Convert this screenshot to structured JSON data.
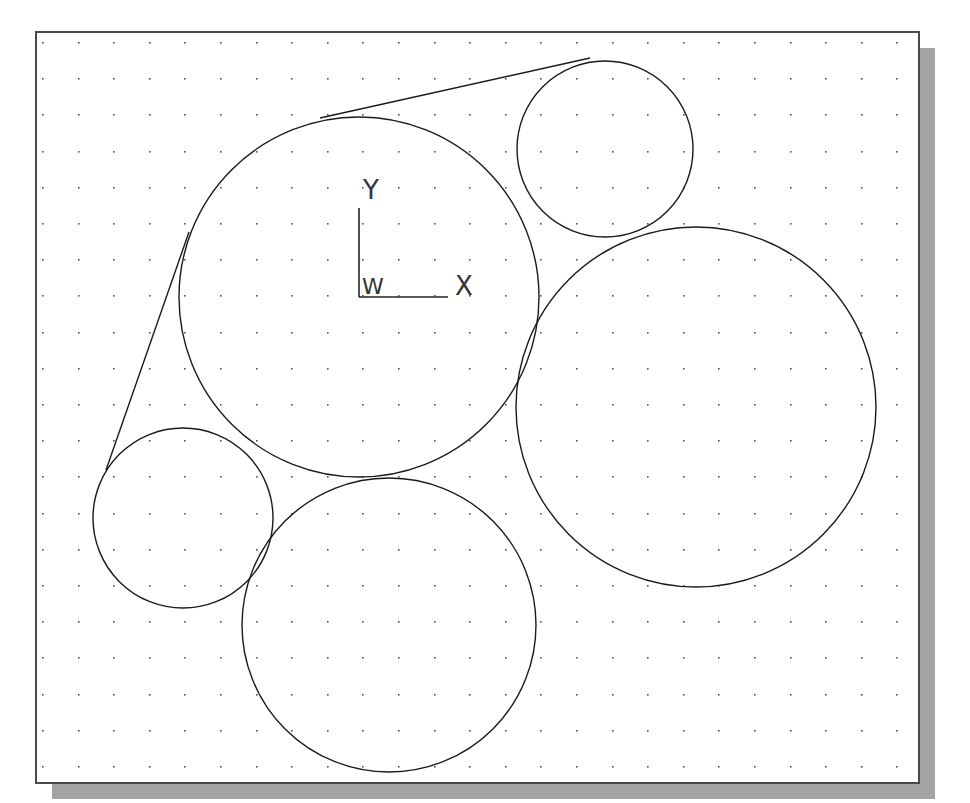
{
  "drawing": {
    "frame": {
      "x": 36,
      "y": 32,
      "width": 883,
      "height": 751,
      "border_color": "#4a4a4a",
      "background": "#ffffff"
    },
    "shadow": {
      "offset": 16,
      "color": "#a3a3a3"
    },
    "grid": {
      "start_x": 42,
      "start_y": 42,
      "spacing_x": 35.6,
      "spacing_y": 36.2,
      "dot_color": "#555555"
    },
    "line_color": "#1a1a1a",
    "circles": [
      {
        "id": "circle-upper-center",
        "cx": 359,
        "cy": 297,
        "r": 180
      },
      {
        "id": "circle-upper-right",
        "cx": 605,
        "cy": 149,
        "r": 88
      },
      {
        "id": "circle-right-large",
        "cx": 696,
        "cy": 407,
        "r": 180
      },
      {
        "id": "circle-lower-left",
        "cx": 183,
        "cy": 518,
        "r": 90
      },
      {
        "id": "circle-bottom-center",
        "cx": 389,
        "cy": 625,
        "r": 147
      }
    ],
    "lines": [
      {
        "id": "tangent-top",
        "x1": 320,
        "y1": 118,
        "x2": 590,
        "y2": 58
      },
      {
        "id": "tangent-left",
        "x1": 189,
        "y1": 232,
        "x2": 106,
        "y2": 470
      }
    ],
    "ucs_icon": {
      "origin_x": 359,
      "origin_y": 297,
      "y_axis_top": 208,
      "x_axis_right": 448,
      "y_label": "Y",
      "x_label": "X",
      "w_label": "W"
    }
  }
}
